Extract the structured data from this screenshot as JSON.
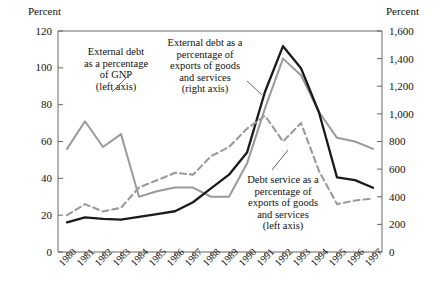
{
  "chart_data": {
    "type": "line",
    "title": "",
    "xlabel": "",
    "ylabel": "Percent",
    "ylabel_right": "Percent",
    "categories": [
      "1980",
      "1981",
      "1982",
      "1983",
      "1984",
      "1985",
      "1986",
      "1987",
      "1988",
      "1989",
      "1990",
      "1991",
      "1992",
      "1993",
      "1994",
      "1995",
      "1996",
      "1997"
    ],
    "ylim": [
      0,
      120
    ],
    "ylim_right": [
      0,
      1600
    ],
    "yticks": [
      "0",
      "20",
      "40",
      "60",
      "80",
      "100",
      "120"
    ],
    "yticks_right": [
      "0",
      "200",
      "400",
      "600",
      "800",
      "1,000",
      "1,200",
      "1,400",
      "1,600"
    ],
    "grid": false,
    "legend_position": "inline-annotations",
    "series": [
      {
        "name": "External debt as a percentage of GNP (left axis)",
        "axis": "left",
        "style": "solid",
        "color": "#9a9a9a",
        "values": [
          56,
          71,
          57,
          64,
          30,
          33,
          35,
          35,
          30,
          30,
          48,
          78,
          105,
          96,
          76,
          62,
          60,
          56
        ]
      },
      {
        "name": "External debt as a percentage of exports of goods and services (right axis)",
        "axis": "right",
        "style": "solid",
        "color": "#1a1a1a",
        "values": [
          215,
          250,
          240,
          235,
          255,
          275,
          295,
          360,
          460,
          560,
          720,
          1160,
          1490,
          1330,
          1010,
          540,
          520,
          465
        ]
      },
      {
        "name": "Debt service as a percentage of exports of goods and services (left axis)",
        "axis": "left",
        "style": "dashed",
        "color": "#9a9a9a",
        "values": [
          20,
          26,
          22,
          24,
          35,
          39,
          43,
          42,
          52,
          57,
          67,
          74,
          60,
          70,
          44,
          26,
          28,
          29
        ]
      }
    ],
    "annotations": [
      {
        "id": "gnp",
        "lines": [
          "External debt",
          "as a percentage",
          "of GNP",
          "(left axis)"
        ]
      },
      {
        "id": "exports",
        "lines": [
          "External debt as a",
          "percentage of",
          "exports of goods",
          "and services",
          "(right axis)"
        ]
      },
      {
        "id": "service",
        "lines": [
          "Debt service as a",
          "percentage of",
          "exports of goods",
          "and services",
          "(left axis)"
        ]
      }
    ]
  }
}
